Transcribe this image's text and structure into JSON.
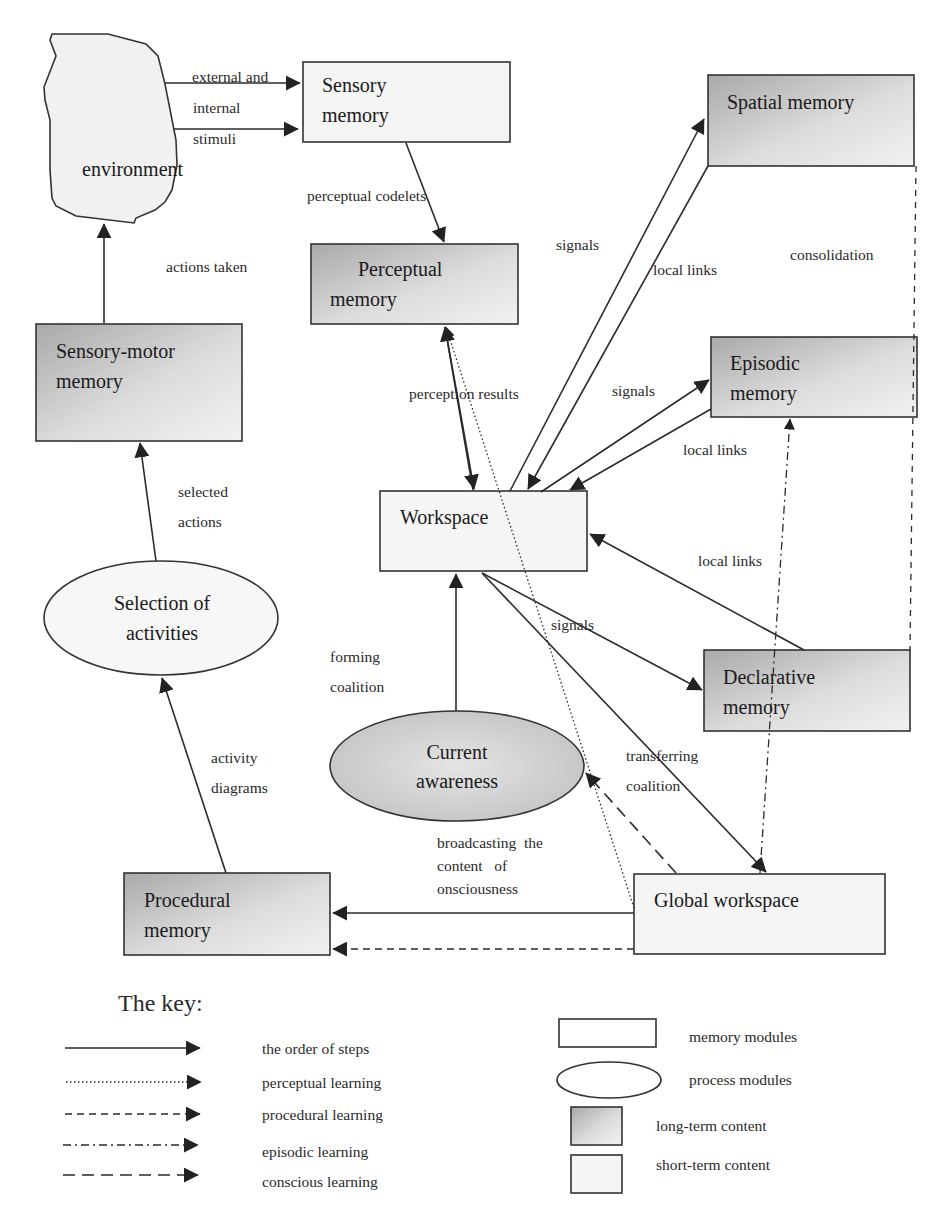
{
  "nodes": {
    "environment": {
      "label": "environment",
      "kind": "cloud"
    },
    "sensory_memory": {
      "lines": [
        "Sensory",
        "memory"
      ],
      "kind": "memory",
      "content": "short-term"
    },
    "perceptual_memory": {
      "lines": [
        "Perceptual",
        "memory"
      ],
      "kind": "memory",
      "content": "long-term"
    },
    "spatial_memory": {
      "lines": [
        "Spatial memory"
      ],
      "kind": "memory",
      "content": "long-term"
    },
    "episodic_memory": {
      "lines": [
        "Episodic",
        "memory"
      ],
      "kind": "memory",
      "content": "long-term"
    },
    "sensory_motor_memory": {
      "lines": [
        "Sensory-motor",
        "memory"
      ],
      "kind": "memory",
      "content": "long-term"
    },
    "workspace": {
      "lines": [
        "Workspace"
      ],
      "kind": "memory",
      "content": "short-term"
    },
    "selection_of_activities": {
      "lines": [
        "Selection of",
        "activities"
      ],
      "kind": "process",
      "content": "short-term"
    },
    "declarative_memory": {
      "lines": [
        "Declarative",
        "memory"
      ],
      "kind": "memory",
      "content": "long-term"
    },
    "current_awareness": {
      "lines": [
        "Current",
        "awareness"
      ],
      "kind": "process",
      "content": "long-term"
    },
    "procedural_memory": {
      "lines": [
        "Procedural",
        "memory"
      ],
      "kind": "memory",
      "content": "long-term"
    },
    "global_workspace": {
      "lines": [
        "Global workspace"
      ],
      "kind": "memory",
      "content": "short-term"
    }
  },
  "edge_labels": {
    "stimuli": [
      "external  and",
      "internal",
      "stimuli"
    ],
    "perceptual_codelets": "perceptual codelets",
    "actions_taken": "actions taken",
    "signals_spatial": "signals",
    "local_links_spatial": "local links",
    "consolidation": "consolidation",
    "perception_results": "perception results",
    "signals_episodic": "signals",
    "local_links_episodic": "local links",
    "selected_actions": [
      "selected",
      "actions"
    ],
    "local_links_declarative": "local links",
    "signals_declarative": "signals",
    "forming_coalition": [
      "forming",
      "coalition"
    ],
    "activity_diagrams": [
      "activity",
      "diagrams"
    ],
    "transferring_coalition": [
      "transferring",
      "coalition"
    ],
    "broadcasting": [
      "broadcasting  the",
      "content   of",
      "onsciousness"
    ]
  },
  "key": {
    "title": "The key:",
    "line_styles": [
      {
        "style": "solid",
        "label": "the order of steps"
      },
      {
        "style": "dotted",
        "label": "perceptual learning"
      },
      {
        "style": "dashed",
        "label": "procedural learning"
      },
      {
        "style": "dash-dot",
        "label": "episodic learning"
      },
      {
        "style": "long-dash",
        "label": "conscious learning"
      }
    ],
    "shapes": [
      {
        "shape": "rectangle",
        "label": "memory modules"
      },
      {
        "shape": "ellipse",
        "label": "process modules"
      },
      {
        "shape": "shaded-square",
        "label": "long-term content"
      },
      {
        "shape": "light-square",
        "label": "short-term content"
      }
    ]
  },
  "colors": {
    "long_term_dark": "#b4b4b4",
    "long_term_light": "#eeeeee",
    "short_term": "#f4f4f4",
    "stroke": "#2b2b2b"
  }
}
